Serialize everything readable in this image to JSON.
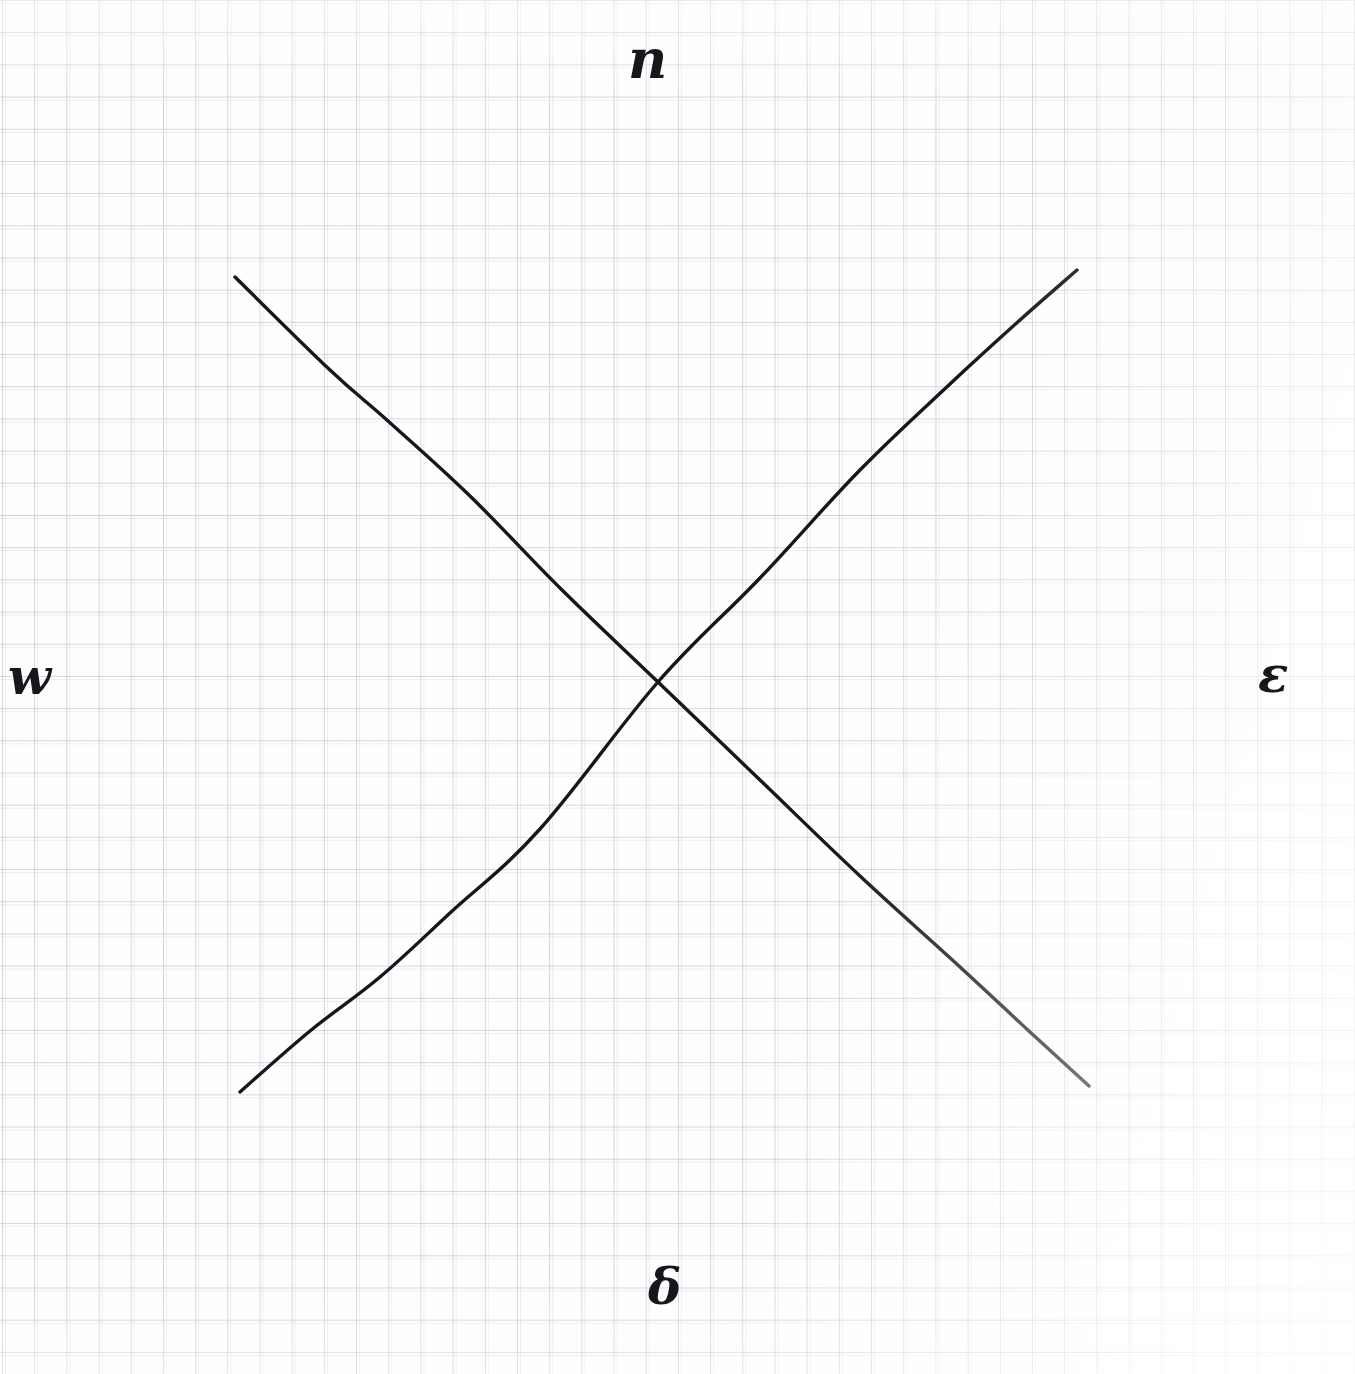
{
  "page": {
    "medium": "pen on graph paper",
    "background_color": "#fdfdfd",
    "grid_color": "#969eac",
    "grid_spacing_px": 32,
    "ink_color": "#15171b",
    "width": 1355,
    "height": 1374
  },
  "labels": {
    "north": "n",
    "east": "ε",
    "south": "δ",
    "west": "w"
  },
  "chart_data": {
    "type": "line",
    "title": "",
    "xlabel": "",
    "ylabel": "",
    "grid": true,
    "legend": "none",
    "xlim": [
      0,
      1355
    ],
    "ylim": [
      1374,
      0
    ],
    "annotations": [
      {
        "text": "n",
        "x": 655,
        "y": 65,
        "name": "north-label"
      },
      {
        "text": "ε",
        "x": 1278,
        "y": 677,
        "name": "east-label"
      },
      {
        "text": "δ",
        "x": 668,
        "y": 1294,
        "name": "south-label"
      },
      {
        "text": "w",
        "x": 30,
        "y": 685,
        "name": "west-label"
      }
    ],
    "intersection": {
      "x": 658,
      "y": 682
    },
    "series": [
      {
        "name": "descending-line",
        "description": "line from upper-left to lower-right",
        "points": [
          [
            235,
            277
          ],
          [
            330,
            370
          ],
          [
            388,
            421
          ],
          [
            470,
            496
          ],
          [
            560,
            588
          ],
          [
            658,
            682
          ],
          [
            760,
            780
          ],
          [
            860,
            876
          ],
          [
            960,
            967
          ],
          [
            1030,
            1032
          ],
          [
            1089,
            1086
          ]
        ]
      },
      {
        "name": "ascending-line",
        "description": "line from lower-left to upper-right",
        "points": [
          [
            240,
            1092
          ],
          [
            310,
            1031
          ],
          [
            380,
            977
          ],
          [
            450,
            913
          ],
          [
            540,
            829
          ],
          [
            658,
            682
          ],
          [
            760,
            578
          ],
          [
            860,
            470
          ],
          [
            950,
            384
          ],
          [
            1020,
            320
          ],
          [
            1077,
            270
          ]
        ]
      }
    ]
  }
}
